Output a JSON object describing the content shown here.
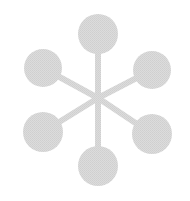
{
  "icon": {
    "name": "network-hub-icon",
    "color": "#d6d6d6",
    "hub": {
      "x": 98,
      "y": 98
    },
    "stroke_width": 6,
    "nodes": [
      {
        "id": "top",
        "x": 98,
        "y": 34,
        "r": 20
      },
      {
        "id": "upper-right",
        "x": 152,
        "y": 70,
        "r": 19
      },
      {
        "id": "lower-right",
        "x": 152,
        "y": 134,
        "r": 20
      },
      {
        "id": "bottom",
        "x": 98,
        "y": 166,
        "r": 20
      },
      {
        "id": "lower-left",
        "x": 43,
        "y": 132,
        "r": 20
      },
      {
        "id": "upper-left",
        "x": 43,
        "y": 68,
        "r": 19
      }
    ]
  }
}
